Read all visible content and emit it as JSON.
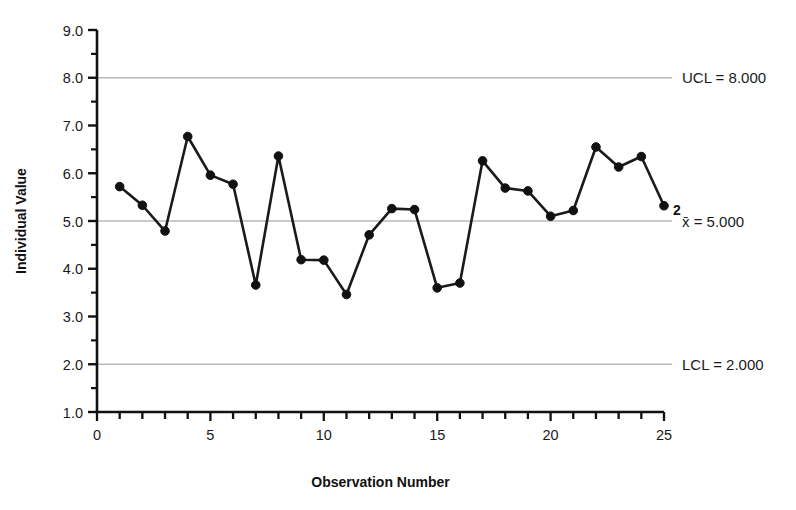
{
  "chart_data": {
    "type": "line",
    "title": "",
    "subtitle": "",
    "xlabel": "Observation Number",
    "ylabel": "Individual Value",
    "x": [
      1,
      2,
      3,
      4,
      5,
      6,
      7,
      8,
      9,
      10,
      11,
      12,
      13,
      14,
      15,
      16,
      17,
      18,
      19,
      20,
      21,
      22,
      23,
      24,
      25
    ],
    "values": [
      5.72,
      5.33,
      4.79,
      6.77,
      5.96,
      5.77,
      3.66,
      6.36,
      4.19,
      4.18,
      3.46,
      4.71,
      5.26,
      5.24,
      3.6,
      3.7,
      6.26,
      5.69,
      5.63,
      5.1,
      5.22,
      6.55,
      6.13,
      6.35,
      5.32
    ],
    "series": [
      {
        "name": "Individual Value",
        "values": [
          5.72,
          5.33,
          4.79,
          6.77,
          5.96,
          5.77,
          3.66,
          6.36,
          4.19,
          4.18,
          3.46,
          4.71,
          5.26,
          5.24,
          3.6,
          3.7,
          6.26,
          5.69,
          5.63,
          5.1,
          5.22,
          6.55,
          6.13,
          6.35,
          5.32
        ]
      }
    ],
    "xlim": [
      0,
      25
    ],
    "ylim": [
      1.0,
      9.0
    ],
    "x_tick_labels": [
      "0",
      "5",
      "10",
      "15",
      "20",
      "25"
    ],
    "x_tick_values": [
      0,
      5,
      10,
      15,
      20,
      25
    ],
    "x_minor_tick_step": 1,
    "y_tick_labels": [
      "1.0",
      "2.0",
      "3.0",
      "4.0",
      "5.0",
      "6.0",
      "7.0",
      "8.0",
      "9.0"
    ],
    "y_tick_values": [
      1.0,
      2.0,
      3.0,
      4.0,
      5.0,
      6.0,
      7.0,
      8.0,
      9.0
    ],
    "y_minor_tick_step": 0.5,
    "grid": false,
    "legend_position": "right-inline",
    "control_limits": [
      {
        "key": "ucl",
        "value": 8.0,
        "label": "UCL = 8.000"
      },
      {
        "key": "center",
        "value": 5.0,
        "label": "x̄ = 5.000"
      },
      {
        "key": "lcl",
        "value": 2.0,
        "label": "LCL = 2.000"
      }
    ],
    "annotations": [
      {
        "text": "2",
        "x": 25,
        "y": 5.32,
        "note": "violation test label at last point"
      }
    ],
    "colors": {
      "line": "#1a1a1a",
      "marker": "#111111",
      "limit_line": "#b8b8b8",
      "axis": "#111111",
      "background": "#ffffff"
    }
  },
  "axes": {
    "y_title": "Individual Value",
    "x_title": "Observation Number"
  },
  "limits": {
    "ucl_label": "UCL = 8.000",
    "center_label": "x̄ = 5.000",
    "lcl_label": "LCL = 2.000"
  },
  "annotation": {
    "last_point_label": "2"
  }
}
